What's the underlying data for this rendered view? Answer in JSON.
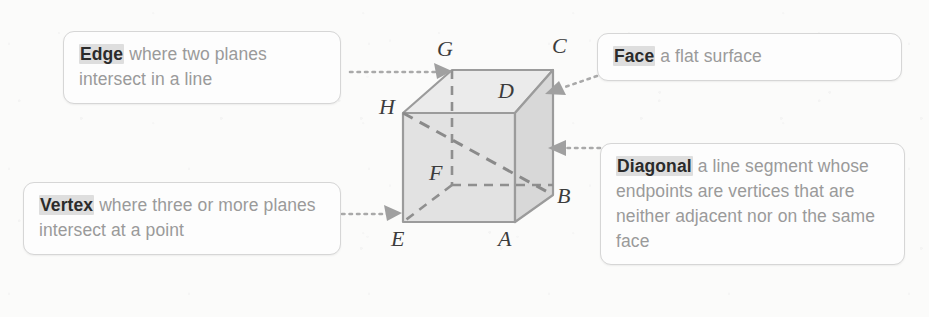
{
  "figure": {
    "shape": "cube",
    "vertex_labels": [
      "A",
      "B",
      "C",
      "D",
      "E",
      "F",
      "G",
      "H"
    ],
    "hidden_vertex": "F",
    "diagonal_endpoints": [
      "H",
      "B"
    ],
    "colors": {
      "front_face": "#e2e2e2",
      "top_face": "#ebebeb",
      "right_face": "#d8d8d8",
      "edge_line": "#9b9b9b",
      "hidden_edge_line": "#8f8f8f",
      "diagonal_line": "#8a8a8a",
      "connector_line": "#a9a9a9",
      "callout_border": "#d6d6d6",
      "callout_text": "#9a9a9a",
      "keyword_text": "#2b2b2b",
      "keyword_highlight": "#dedede"
    }
  },
  "callouts": {
    "edge": {
      "keyword": "Edge",
      "definition": "where two planes intersect in a line",
      "points_to": "G"
    },
    "vertex": {
      "keyword": "Vertex",
      "definition": "where three or more planes intersect at a point",
      "points_to": "E"
    },
    "face": {
      "keyword": "Face",
      "definition": "a flat surface",
      "points_to": "top face"
    },
    "diagonal": {
      "keyword": "Diagonal",
      "definition": "a line segment whose endpoints are vertices that are neither adjacent nor on the same face",
      "points_to": "diagonal HB"
    }
  },
  "labels": {
    "A": "A",
    "B": "B",
    "C": "C",
    "D": "D",
    "E": "E",
    "F": "F",
    "G": "G",
    "H": "H"
  }
}
